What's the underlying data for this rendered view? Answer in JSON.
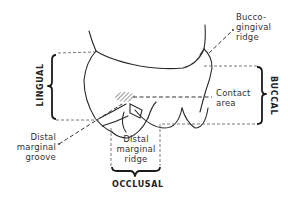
{
  "figure": {
    "sides": {
      "lingual": "LINGUAL",
      "buccal": "BUCCAL",
      "occlusal": "OCCLUSAL"
    },
    "labels": {
      "buccogingival_ridge": [
        "Bucco-",
        "gingival",
        "ridge"
      ],
      "contact_area": [
        "Contact",
        "area"
      ],
      "distal_marginal_groove": [
        "Distal",
        "marginal",
        "groove"
      ],
      "distal_marginal_ridge": [
        "Distal",
        "marginal",
        "ridge"
      ]
    },
    "colors": {
      "line": "#2a2a2a",
      "background": "#ffffff"
    }
  }
}
